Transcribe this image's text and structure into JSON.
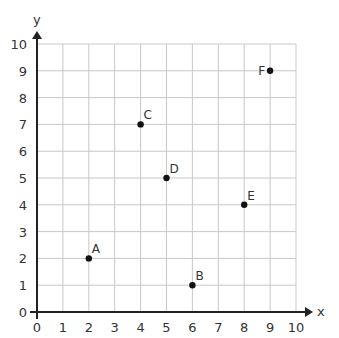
{
  "chart_data": {
    "type": "scatter",
    "title": "",
    "xlabel": "x",
    "ylabel": "y",
    "xlim": [
      0,
      10
    ],
    "ylim": [
      0,
      10
    ],
    "grid": true,
    "x_ticks": [
      "0",
      "1",
      "2",
      "3",
      "4",
      "5",
      "6",
      "7",
      "8",
      "9",
      "10"
    ],
    "y_ticks": [
      "0",
      "1",
      "2",
      "3",
      "4",
      "5",
      "6",
      "7",
      "8",
      "9",
      "10"
    ],
    "points": [
      {
        "label": "A",
        "x": 2,
        "y": 2,
        "label_pos": "upper-right"
      },
      {
        "label": "B",
        "x": 6,
        "y": 1,
        "label_pos": "upper-right"
      },
      {
        "label": "C",
        "x": 4,
        "y": 7,
        "label_pos": "upper-right"
      },
      {
        "label": "D",
        "x": 5,
        "y": 5,
        "label_pos": "upper-right"
      },
      {
        "label": "E",
        "x": 8,
        "y": 4,
        "label_pos": "upper-right"
      },
      {
        "label": "F",
        "x": 9,
        "y": 9,
        "label_pos": "left"
      }
    ],
    "legend": null
  },
  "style": {
    "grid_color": "#c8c8c8",
    "axis_color": "#222222",
    "point_color": "#111111",
    "text_color": "#333333"
  }
}
